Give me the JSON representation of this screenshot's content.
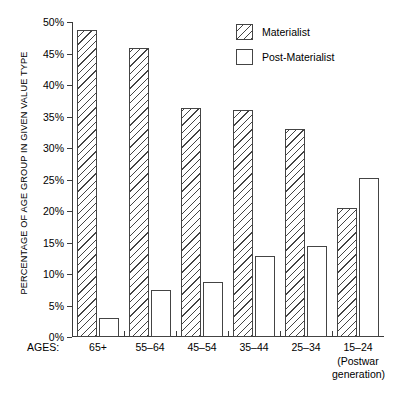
{
  "chart_data": {
    "type": "bar",
    "title": "",
    "xlabel": "AGES:",
    "ylabel": "PERCENTAGE OF AGE GROUP IN GIVEN VALUE TYPE",
    "categories": [
      "65+",
      "55–64",
      "45–54",
      "35–44",
      "25–34",
      "15–24"
    ],
    "category_sublabels": [
      "",
      "",
      "",
      "",
      "",
      "(Postwar generation)"
    ],
    "series": [
      {
        "name": "Materialist",
        "values": [
          48.7,
          45.8,
          36.4,
          36.0,
          33.0,
          20.4
        ]
      },
      {
        "name": "Post-Materialist",
        "values": [
          3.0,
          7.5,
          8.7,
          12.8,
          14.5,
          25.3
        ]
      }
    ],
    "ylim": [
      0,
      50
    ],
    "ytick_values": [
      0,
      5,
      10,
      15,
      20,
      25,
      30,
      35,
      40,
      45,
      50
    ],
    "ytick_labels": [
      "0%",
      "5%",
      "10%",
      "15%",
      "20%",
      "25%",
      "30%",
      "35%",
      "40%",
      "45%",
      "50%"
    ],
    "grid": false,
    "legend_position": "top-right",
    "colors": {
      "materialist_fill": "#ffffff",
      "materialist_hatch": "#444444",
      "postmaterialist_fill": "#ffffff",
      "outline": "#444444",
      "axis": "#3a3a3a",
      "text": "#000000"
    }
  },
  "axis": {
    "ages_label": "AGES:",
    "y_title": "PERCENTAGE OF AGE GROUP IN GIVEN VALUE TYPE"
  },
  "legend": {
    "items": [
      {
        "label": "Materialist",
        "pattern": "diagonal-hatch"
      },
      {
        "label": "Post-Materialist",
        "pattern": "solid-white"
      }
    ]
  },
  "category_labels": [
    {
      "main": "65+",
      "sub": ""
    },
    {
      "main": "55–64",
      "sub": ""
    },
    {
      "main": "45–54",
      "sub": ""
    },
    {
      "main": "35–44",
      "sub": ""
    },
    {
      "main": "25–34",
      "sub": ""
    },
    {
      "main": "15–24",
      "sub_line1": "(Postwar",
      "sub_line2": "generation)"
    }
  ]
}
